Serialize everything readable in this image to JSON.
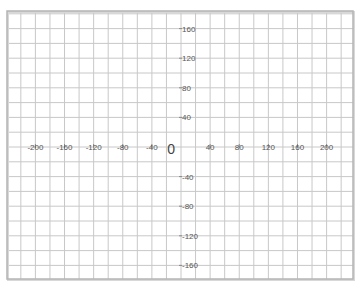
{
  "chart_data": {
    "type": "scatter",
    "title": "",
    "xlabel": "",
    "ylabel": "",
    "xlim": [
      -240,
      240
    ],
    "ylim": [
      -180,
      180
    ],
    "grid": true,
    "grid_step": 20,
    "x_ticks": [
      -200,
      -160,
      -120,
      -80,
      -40,
      40,
      80,
      120,
      160,
      200
    ],
    "y_ticks": [
      160,
      120,
      80,
      40,
      -40,
      -80,
      -120,
      -160
    ],
    "x_tick_labels": [
      "-200",
      "-160",
      "-120",
      "-80",
      "-40",
      "40",
      "80",
      "120",
      "160",
      "200"
    ],
    "y_tick_labels": [
      "160",
      "120",
      "80",
      "40",
      "-40",
      "-80",
      "-120",
      "-160"
    ],
    "origin_label": "0",
    "series": [],
    "legend": null
  },
  "colors": {
    "grid": "#c8c8c8",
    "frame": "#b4b4b4",
    "frame_shadow": "#d8d8d8",
    "text": "#555555",
    "background": "#ffffff"
  },
  "layout": {
    "frame": {
      "x": 7,
      "y": 11,
      "w": 346,
      "h": 268
    },
    "origin_px": {
      "x": 181,
      "y": 147
    },
    "px_per_unit_x": 0.728,
    "px_per_unit_y": 0.74
  }
}
